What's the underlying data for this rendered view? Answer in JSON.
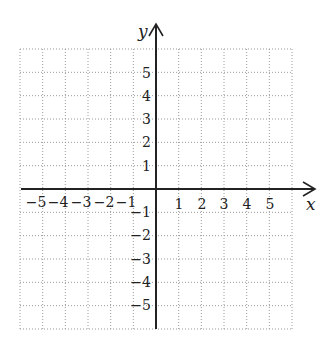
{
  "chart_data": {
    "type": "coordinate-grid",
    "title": "",
    "xlabel": "x",
    "ylabel": "y",
    "xlim": [
      -6,
      6
    ],
    "ylim": [
      -6,
      6
    ],
    "grid": true,
    "grid_style": "dotted",
    "x_tick_labels": [
      "-5",
      "-4",
      "-3",
      "-2",
      "-1",
      "1",
      "2",
      "3",
      "4",
      "5"
    ],
    "y_tick_labels": [
      "5",
      "4",
      "3",
      "2",
      "1",
      "-1",
      "-2",
      "-3",
      "-4",
      "-5"
    ],
    "x_ticks": [
      -5,
      -4,
      -3,
      -2,
      -1,
      1,
      2,
      3,
      4,
      5
    ],
    "y_ticks": [
      5,
      4,
      3,
      2,
      1,
      -1,
      -2,
      -3,
      -4,
      -5
    ],
    "data_points": []
  },
  "axes": {
    "x_label": "x",
    "y_label": "y"
  },
  "labels": {
    "x": [
      "−5",
      "−4",
      "−3",
      "−2",
      "−1",
      "1",
      "2",
      "3",
      "4",
      "5"
    ],
    "y": [
      "5",
      "4",
      "3",
      "2",
      "1",
      "−1",
      "−2",
      "−3",
      "−4",
      "−5"
    ]
  },
  "colors": {
    "axis": "#222222",
    "grid": "#9a9a9a",
    "background": "#ffffff"
  }
}
